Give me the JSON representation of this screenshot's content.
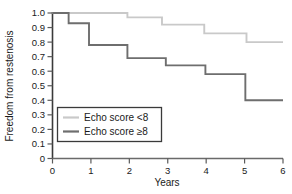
{
  "chart_data": {
    "type": "line",
    "title": "",
    "subtitle": "",
    "xlabel": "Years",
    "ylabel": "Freedom from restenosis",
    "xlim": [
      0,
      6
    ],
    "ylim": [
      0,
      1.0
    ],
    "xticks": [
      "0",
      "1",
      "2",
      "3",
      "4",
      "5",
      "6"
    ],
    "xtick_values": [
      0,
      1,
      2,
      3,
      4,
      5,
      6
    ],
    "yticks": [
      "0",
      "0.1",
      "0.2",
      "0.3",
      "0.4",
      "0.5",
      "0.6",
      "0.7",
      "0.8",
      "0.9",
      "1.0"
    ],
    "ytick_values": [
      0,
      0.1,
      0.2,
      0.3,
      0.4,
      0.5,
      0.6,
      0.7,
      0.8,
      0.9,
      1.0
    ],
    "grid": false,
    "style": "kaplan-meier-step",
    "legend_position": "lower-left-inside",
    "series": [
      {
        "name": "Echo score <8",
        "color": "#c9c9c9",
        "step_points": [
          {
            "x": 0.0,
            "y": 1.0
          },
          {
            "x": 1.95,
            "y": 1.0
          },
          {
            "x": 1.95,
            "y": 0.97
          },
          {
            "x": 2.85,
            "y": 0.97
          },
          {
            "x": 2.85,
            "y": 0.92
          },
          {
            "x": 3.95,
            "y": 0.92
          },
          {
            "x": 3.95,
            "y": 0.86
          },
          {
            "x": 5.05,
            "y": 0.86
          },
          {
            "x": 5.05,
            "y": 0.8
          },
          {
            "x": 6.0,
            "y": 0.8
          }
        ]
      },
      {
        "name": "Echo score ≥8",
        "color": "#6e6e6e",
        "step_points": [
          {
            "x": 0.0,
            "y": 1.0
          },
          {
            "x": 0.42,
            "y": 1.0
          },
          {
            "x": 0.42,
            "y": 0.93
          },
          {
            "x": 0.95,
            "y": 0.93
          },
          {
            "x": 0.95,
            "y": 0.78
          },
          {
            "x": 1.95,
            "y": 0.78
          },
          {
            "x": 1.95,
            "y": 0.69
          },
          {
            "x": 2.95,
            "y": 0.69
          },
          {
            "x": 2.95,
            "y": 0.64
          },
          {
            "x": 3.98,
            "y": 0.64
          },
          {
            "x": 3.98,
            "y": 0.58
          },
          {
            "x": 5.02,
            "y": 0.58
          },
          {
            "x": 5.02,
            "y": 0.4
          },
          {
            "x": 6.0,
            "y": 0.4
          }
        ]
      }
    ]
  },
  "legend": {
    "entries": [
      {
        "label": "Echo score <8",
        "color": "#c9c9c9"
      },
      {
        "label": "Echo score ≥8",
        "color": "#6e6e6e"
      }
    ]
  },
  "axes": {
    "x_title": "Years",
    "y_title": "Freedom from restenosis"
  }
}
